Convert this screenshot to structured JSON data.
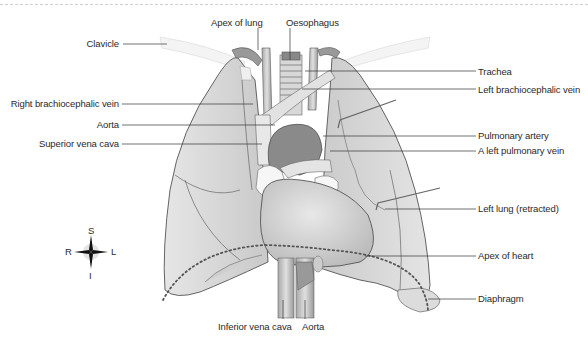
{
  "figure": {
    "labels_left": [
      {
        "id": "clavicle",
        "text": "Clavicle"
      },
      {
        "id": "right-brachiocephalic-vein",
        "text": "Right brachiocephalic vein"
      },
      {
        "id": "aorta-upper",
        "text": "Aorta"
      },
      {
        "id": "superior-vena-cava",
        "text": "Superior vena cava"
      }
    ],
    "labels_top": [
      {
        "id": "apex-of-lung",
        "text": "Apex of lung"
      },
      {
        "id": "oesophagus",
        "text": "Oesophagus"
      }
    ],
    "labels_right": [
      {
        "id": "trachea",
        "text": "Trachea"
      },
      {
        "id": "left-brachiocephalic-vein",
        "text": "Left brachiocephalic vein"
      },
      {
        "id": "pulmonary-artery",
        "text": "Pulmonary artery"
      },
      {
        "id": "left-pulmonary-vein",
        "text": "A left pulmonary vein"
      },
      {
        "id": "left-lung-retracted",
        "text": "Left lung (retracted)"
      },
      {
        "id": "apex-of-heart",
        "text": "Apex of heart"
      },
      {
        "id": "diaphragm",
        "text": "Diaphragm"
      }
    ],
    "labels_bottom": [
      {
        "id": "inferior-vena-cava",
        "text": "Inferior vena cava"
      },
      {
        "id": "aorta-lower",
        "text": "Aorta"
      }
    ],
    "compass": {
      "superior": "S",
      "inferior": "I",
      "right": "R",
      "left": "L"
    },
    "colors": {
      "lung_fill": "#dcdcdc",
      "lung_edge": "#555555",
      "heart_fill": "#cfcfcf",
      "vessel_dark": "#7a7a7a",
      "leader_line": "#333333",
      "diaphragm_dots": "#555555"
    }
  }
}
